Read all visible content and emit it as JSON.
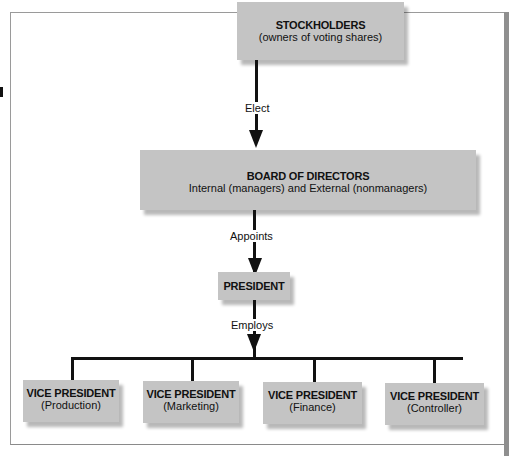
{
  "diagram": {
    "nodes": {
      "stockholders": {
        "title": "STOCKHOLDERS",
        "subtitle": "(owners of voting shares)"
      },
      "board": {
        "title": "BOARD OF DIRECTORS",
        "subtitle": "Internal (managers) and External (nonmanagers)"
      },
      "president": {
        "title": "PRESIDENT"
      },
      "vps": [
        {
          "title": "VICE PRESIDENT",
          "subtitle": "(Production)"
        },
        {
          "title": "VICE PRESIDENT",
          "subtitle": "(Marketing)"
        },
        {
          "title": "VICE PRESIDENT",
          "subtitle": "(Finance)"
        },
        {
          "title": "VICE PRESIDENT",
          "subtitle": "(Controller)"
        }
      ]
    },
    "edges": {
      "elect": "Elect",
      "appoints": "Appoints",
      "employs": "Employs"
    },
    "colors": {
      "box_fill": "#c4c4c4",
      "line": "#111111",
      "frame": "#9a9a9a"
    }
  }
}
